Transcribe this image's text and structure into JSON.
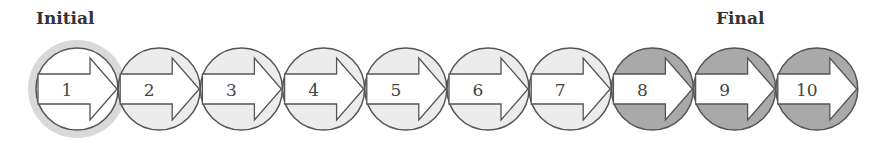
{
  "labels": {
    "initial": "Initial",
    "final": "Final"
  },
  "colors": {
    "stroke": "#555555",
    "initial_fill": "#ffffff",
    "halo": "#d9d9d9",
    "light_fill": "#ececec",
    "dark_fill": "#a9a9a9",
    "arrow_fill": "#ffffff"
  },
  "steps": [
    {
      "number": "1",
      "state": "initial"
    },
    {
      "number": "2",
      "state": "light"
    },
    {
      "number": "3",
      "state": "light"
    },
    {
      "number": "4",
      "state": "light"
    },
    {
      "number": "5",
      "state": "light"
    },
    {
      "number": "6",
      "state": "light"
    },
    {
      "number": "7",
      "state": "light"
    },
    {
      "number": "8",
      "state": "dark"
    },
    {
      "number": "9",
      "state": "dark"
    },
    {
      "number": "10",
      "state": "dark"
    }
  ]
}
